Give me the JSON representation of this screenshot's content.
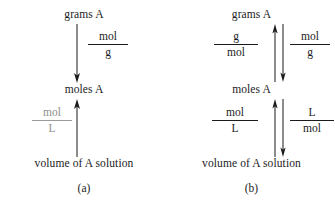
{
  "figure": {
    "title": "",
    "background": "#ffffff",
    "ink": "#1b1b1b",
    "muted_ink": "#8e8e8e"
  },
  "panels": [
    {
      "id": "a",
      "caption": "(a)",
      "nodes": [
        {
          "id": "grams-a",
          "label": "grams A"
        },
        {
          "id": "moles-a",
          "label": "moles A"
        },
        {
          "id": "volume-a",
          "label": "volume of A solution"
        }
      ],
      "conversions": [
        {
          "id": "mol-per-g",
          "numerator": "mol",
          "denominator": "g",
          "direction": "down",
          "from": "grams A",
          "to": "moles A",
          "muted": false
        },
        {
          "id": "mol-per-l",
          "numerator": "mol",
          "denominator": "L",
          "direction": "up",
          "from": "volume of A solution",
          "to": "moles A",
          "muted": true
        }
      ]
    },
    {
      "id": "b",
      "caption": "(b)",
      "nodes": [
        {
          "id": "grams-a",
          "label": "grams A"
        },
        {
          "id": "moles-a",
          "label": "moles A"
        },
        {
          "id": "volume-a",
          "label": "volume of A solution"
        }
      ],
      "conversions": [
        {
          "id": "g-per-mol",
          "numerator": "g",
          "denominator": "mol",
          "direction": "up",
          "from": "moles A",
          "to": "grams A",
          "muted": false
        },
        {
          "id": "mol-per-g",
          "numerator": "mol",
          "denominator": "g",
          "direction": "down",
          "from": "grams A",
          "to": "moles A",
          "muted": false
        },
        {
          "id": "mol-per-l",
          "numerator": "mol",
          "denominator": "L",
          "direction": "up",
          "from": "volume of A solution",
          "to": "moles A",
          "muted": false
        },
        {
          "id": "l-per-mol",
          "numerator": "L",
          "denominator": "mol",
          "direction": "down",
          "from": "moles A",
          "to": "volume of A solution",
          "muted": false
        }
      ]
    }
  ]
}
